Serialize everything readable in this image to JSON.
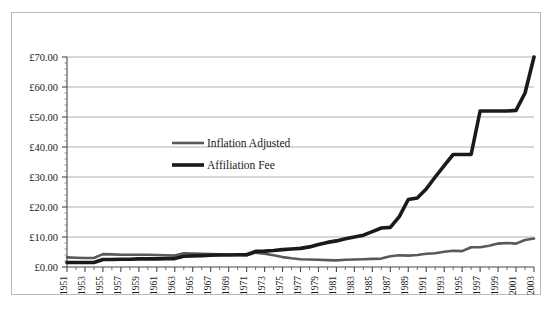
{
  "chart_data": {
    "type": "line",
    "title": "",
    "xlabel": "",
    "ylabel": "",
    "ylim": [
      0,
      70
    ],
    "xlim": [
      1951,
      2003
    ],
    "grid": true,
    "y_ticks": [
      0,
      10,
      20,
      30,
      40,
      50,
      60,
      70
    ],
    "y_tick_labels": [
      "£0.00",
      "£10.00",
      "£20.00",
      "£30.00",
      "£40.00",
      "£50.00",
      "£60.00",
      "£70.00"
    ],
    "y_tick_prefix": "£",
    "minor_ticks": true,
    "x_tick_step": 2,
    "x_tick_labels": [
      "1951",
      "1953",
      "1955",
      "1957",
      "1959",
      "1961",
      "1963",
      "1965",
      "1967",
      "1969",
      "1971",
      "1973",
      "1975",
      "1977",
      "1979",
      "1981",
      "1983",
      "1985",
      "1987",
      "1989",
      "1991",
      "1993",
      "1995",
      "1997",
      "1999",
      "2001",
      "2003"
    ],
    "legend_position": "inside-upper-left",
    "x": [
      1951,
      1952,
      1953,
      1954,
      1955,
      1956,
      1957,
      1958,
      1959,
      1960,
      1961,
      1962,
      1963,
      1964,
      1965,
      1966,
      1967,
      1968,
      1969,
      1970,
      1971,
      1972,
      1973,
      1974,
      1975,
      1976,
      1977,
      1978,
      1979,
      1980,
      1981,
      1982,
      1983,
      1984,
      1985,
      1986,
      1987,
      1988,
      1989,
      1990,
      1991,
      1992,
      1993,
      1994,
      1995,
      1996,
      1997,
      1998,
      1999,
      2000,
      2001,
      2002,
      2003
    ],
    "series": [
      {
        "name": "Inflation Adjusted",
        "color": "#595959",
        "width": 2.6,
        "values": [
          3.2,
          3.1,
          3.0,
          3.0,
          4.3,
          4.2,
          4.1,
          4.1,
          4.1,
          4.1,
          4.0,
          3.9,
          3.8,
          4.6,
          4.5,
          4.4,
          4.3,
          4.2,
          4.1,
          4.0,
          3.9,
          4.8,
          4.4,
          3.9,
          3.3,
          2.9,
          2.6,
          2.5,
          2.4,
          2.3,
          2.2,
          2.4,
          2.5,
          2.6,
          2.7,
          2.8,
          3.6,
          3.9,
          3.8,
          4.0,
          4.4,
          4.6,
          5.1,
          5.4,
          5.3,
          6.6,
          6.6,
          7.1,
          7.8,
          8.0,
          7.8,
          9.0,
          9.5
        ]
      },
      {
        "name": "Affiliation Fee",
        "color": "#1a1a1a",
        "width": 3.6,
        "values": [
          1.5,
          1.5,
          1.5,
          1.5,
          2.5,
          2.5,
          2.6,
          2.6,
          2.7,
          2.7,
          2.7,
          2.8,
          2.8,
          3.6,
          3.7,
          3.8,
          3.9,
          4.0,
          4.0,
          4.1,
          4.1,
          5.2,
          5.3,
          5.5,
          5.8,
          6.0,
          6.2,
          6.7,
          7.5,
          8.2,
          8.7,
          9.4,
          10.0,
          10.6,
          11.8,
          13.0,
          13.2,
          16.8,
          22.5,
          23.0,
          26.0,
          30.0,
          33.8,
          37.5,
          37.5,
          37.5,
          52.0,
          52.0,
          52.0,
          52.0,
          52.2,
          58.0,
          70.0
        ]
      }
    ]
  },
  "legend": {
    "items": [
      {
        "label": "Inflation Adjusted"
      },
      {
        "label": "Affiliation Fee"
      }
    ]
  }
}
